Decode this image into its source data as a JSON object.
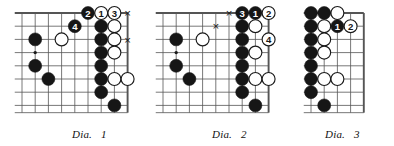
{
  "page": {
    "width": 394,
    "height": 146,
    "background": "#ffffff",
    "content_type": "go-game-diagrams",
    "ink_color": "#1a1a1a",
    "grid_color": "#555555",
    "black_stone_color": "#161616",
    "white_stone_color": "#ffffff",
    "white_stone_border": "#1a1a1a"
  },
  "diagrams": [
    {
      "id": "dia-1",
      "caption_label": "Dia.",
      "caption_number": "1",
      "caption_x": 72,
      "caption_y": 128,
      "origin_x": 22,
      "origin_y": 13,
      "cell": 13.2,
      "cols": 9,
      "rows": 8,
      "edges": {
        "top": true,
        "right": true,
        "left": false,
        "bottom": false
      },
      "star_points": [
        {
          "col": 1,
          "row": 3
        }
      ],
      "black_stones": [
        {
          "col": 1,
          "row": 2
        },
        {
          "col": 1,
          "row": 4
        },
        {
          "col": 2,
          "row": 5
        },
        {
          "col": 6,
          "row": 1
        },
        {
          "col": 6,
          "row": 2
        },
        {
          "col": 6,
          "row": 3
        },
        {
          "col": 6,
          "row": 4
        },
        {
          "col": 6,
          "row": 5
        },
        {
          "col": 6,
          "row": 6
        },
        {
          "col": 7,
          "row": 7
        }
      ],
      "white_stones": [
        {
          "col": 3,
          "row": 2
        },
        {
          "col": 7,
          "row": 1
        },
        {
          "col": 7,
          "row": 2
        },
        {
          "col": 7,
          "row": 3
        },
        {
          "col": 7,
          "row": 5
        },
        {
          "col": 8,
          "row": 5
        }
      ],
      "numbered_moves": [
        {
          "col": 5,
          "row": 0,
          "number": "2",
          "color": "black"
        },
        {
          "col": 4,
          "row": 1,
          "number": "4",
          "color": "black"
        },
        {
          "col": 6,
          "row": 0,
          "number": "1",
          "color": "white"
        },
        {
          "col": 7,
          "row": 0,
          "number": "3",
          "color": "white"
        }
      ],
      "marks": [
        {
          "col": 8,
          "row": 0,
          "glyph": "×"
        },
        {
          "col": 8,
          "row": 2,
          "glyph": "×"
        }
      ]
    },
    {
      "id": "dia-2",
      "caption_label": "Dia.",
      "caption_number": "2",
      "caption_x": 212,
      "caption_y": 128,
      "origin_x": 163,
      "origin_y": 13,
      "cell": 13.2,
      "cols": 9,
      "rows": 8,
      "edges": {
        "top": true,
        "right": true,
        "left": false,
        "bottom": false
      },
      "star_points": [
        {
          "col": 1,
          "row": 3
        }
      ],
      "black_stones": [
        {
          "col": 1,
          "row": 2
        },
        {
          "col": 1,
          "row": 4
        },
        {
          "col": 2,
          "row": 5
        },
        {
          "col": 6,
          "row": 1
        },
        {
          "col": 6,
          "row": 2
        },
        {
          "col": 6,
          "row": 3
        },
        {
          "col": 6,
          "row": 4
        },
        {
          "col": 6,
          "row": 5
        },
        {
          "col": 6,
          "row": 6
        },
        {
          "col": 7,
          "row": 7
        }
      ],
      "white_stones": [
        {
          "col": 3,
          "row": 2
        },
        {
          "col": 7,
          "row": 1
        },
        {
          "col": 7,
          "row": 3
        },
        {
          "col": 7,
          "row": 5
        },
        {
          "col": 8,
          "row": 5
        }
      ],
      "numbered_moves": [
        {
          "col": 6,
          "row": 0,
          "number": "3",
          "color": "black"
        },
        {
          "col": 7,
          "row": 0,
          "number": "1",
          "color": "black"
        },
        {
          "col": 8,
          "row": 0,
          "number": "2",
          "color": "white"
        },
        {
          "col": 8,
          "row": 2,
          "number": "4",
          "color": "white"
        }
      ],
      "marks": [
        {
          "col": 5,
          "row": 0,
          "glyph": "×"
        },
        {
          "col": 4,
          "row": 1,
          "glyph": "×"
        }
      ]
    },
    {
      "id": "dia-3",
      "caption_label": "Dia.",
      "caption_number": "3",
      "caption_x": 325,
      "caption_y": 128,
      "origin_x": 311,
      "origin_y": 13,
      "cell": 13.2,
      "cols": 5,
      "rows": 8,
      "edges": {
        "top": true,
        "right": true,
        "left": false,
        "bottom": false
      },
      "star_points": [],
      "black_stones": [
        {
          "col": 0,
          "row": 0
        },
        {
          "col": 1,
          "row": 0
        },
        {
          "col": 0,
          "row": 1
        },
        {
          "col": 0,
          "row": 2
        },
        {
          "col": 0,
          "row": 3
        },
        {
          "col": 0,
          "row": 4
        },
        {
          "col": 0,
          "row": 5
        },
        {
          "col": 0,
          "row": 6
        },
        {
          "col": 1,
          "row": 7
        }
      ],
      "white_stones": [
        {
          "col": 2,
          "row": 0
        },
        {
          "col": 1,
          "row": 1
        },
        {
          "col": 1,
          "row": 2
        },
        {
          "col": 1,
          "row": 3
        },
        {
          "col": 1,
          "row": 5
        },
        {
          "col": 2,
          "row": 5
        }
      ],
      "numbered_moves": [
        {
          "col": 2,
          "row": 1,
          "number": "1",
          "color": "black"
        },
        {
          "col": 3,
          "row": 1,
          "number": "2",
          "color": "white"
        }
      ],
      "marks": []
    }
  ]
}
